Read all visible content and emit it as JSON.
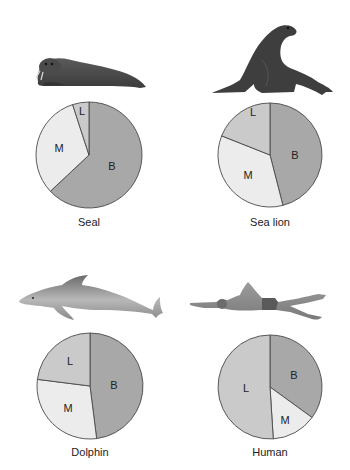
{
  "colors": {
    "B": "#a8a8a8",
    "L": "#cacaca",
    "M": "#ececec",
    "outline": "#4a4a4a",
    "animal_dark": "#3a3a3a",
    "animal_mid": "#707070",
    "animal_light": "#9a9a9a"
  },
  "chart_data": {
    "type": "pie",
    "title": "",
    "slice_keys": [
      "B",
      "M",
      "L"
    ],
    "charts": [
      {
        "name": "Seal",
        "caption": "Seal",
        "cx": 89,
        "cy": 155,
        "r": 53,
        "values": {
          "B": 63,
          "M": 32,
          "L": 5
        },
        "label_pos": {
          "B": [
            112,
            167
          ],
          "M": [
            59,
            149
          ],
          "L": [
            82,
            112
          ]
        }
      },
      {
        "name": "Sea lion",
        "caption": "Sea lion",
        "cx": 270,
        "cy": 155,
        "r": 52,
        "values": {
          "B": 46,
          "M": 35,
          "L": 19
        },
        "label_pos": {
          "B": [
            295,
            156
          ],
          "M": [
            248,
            176
          ],
          "L": [
            253,
            113
          ]
        }
      },
      {
        "name": "Dolphin",
        "caption": "Dolphin",
        "cx": 90,
        "cy": 386,
        "r": 53,
        "values": {
          "B": 48,
          "M": 29,
          "L": 23
        },
        "label_pos": {
          "B": [
            114,
            386
          ],
          "M": [
            68,
            409
          ],
          "L": [
            70,
            362
          ]
        }
      },
      {
        "name": "Human",
        "caption": "Human",
        "cx": 270,
        "cy": 387,
        "r": 52,
        "values": {
          "B": 35,
          "M": 14,
          "L": 51
        },
        "label_pos": {
          "B": [
            294,
            376
          ],
          "M": [
            285,
            421
          ],
          "L": [
            246,
            389
          ]
        }
      }
    ],
    "slice_order_clockwise_from_top": [
      "B",
      "M",
      "L"
    ],
    "legend": null,
    "annotations": [
      "B",
      "M",
      "L"
    ]
  },
  "captions": {
    "seal": "Seal",
    "sea_lion": "Sea lion",
    "dolphin": "Dolphin",
    "human": "Human"
  },
  "illustrations": [
    "seal-illustration",
    "sea-lion-illustration",
    "dolphin-illustration",
    "human-swimmer-illustration"
  ]
}
